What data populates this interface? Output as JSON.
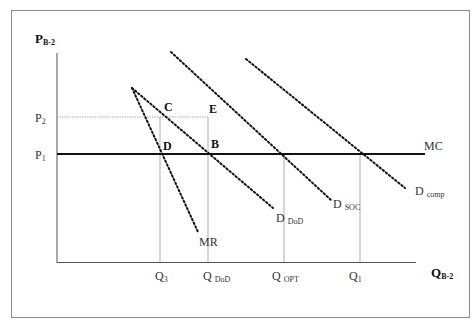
{
  "diagram": {
    "type": "economics supply-demand diagram",
    "axes": {
      "y_label": {
        "main": "P",
        "sub": "B-2"
      },
      "x_label": {
        "main": "Q",
        "sub": "B-2"
      }
    },
    "price_levels": [
      {
        "main": "P",
        "sub": "2"
      },
      {
        "main": "P",
        "sub": "1"
      }
    ],
    "quantity_levels": [
      {
        "main": "Q",
        "sub": "3"
      },
      {
        "main": "Q",
        "sub": "DoD"
      },
      {
        "main": "Q",
        "sub": "OPT"
      },
      {
        "main": "Q",
        "sub": "1"
      }
    ],
    "curves": {
      "mc": {
        "main": "MC"
      },
      "mr": {
        "main": "MR"
      },
      "d_dod": {
        "main": "D",
        "sub": "DoD"
      },
      "d_soc": {
        "main": "D",
        "sub": "SOC"
      },
      "d_comp": {
        "main": "D",
        "sub": "comp"
      }
    },
    "points": {
      "c": "C",
      "e": "E",
      "d": "D",
      "b": "B"
    }
  },
  "colors": {
    "frame": "#8a8a8a",
    "axis": "#555555",
    "mc_line": "#111111",
    "dotted_curve": "#111111",
    "guide_line": "#999999"
  }
}
